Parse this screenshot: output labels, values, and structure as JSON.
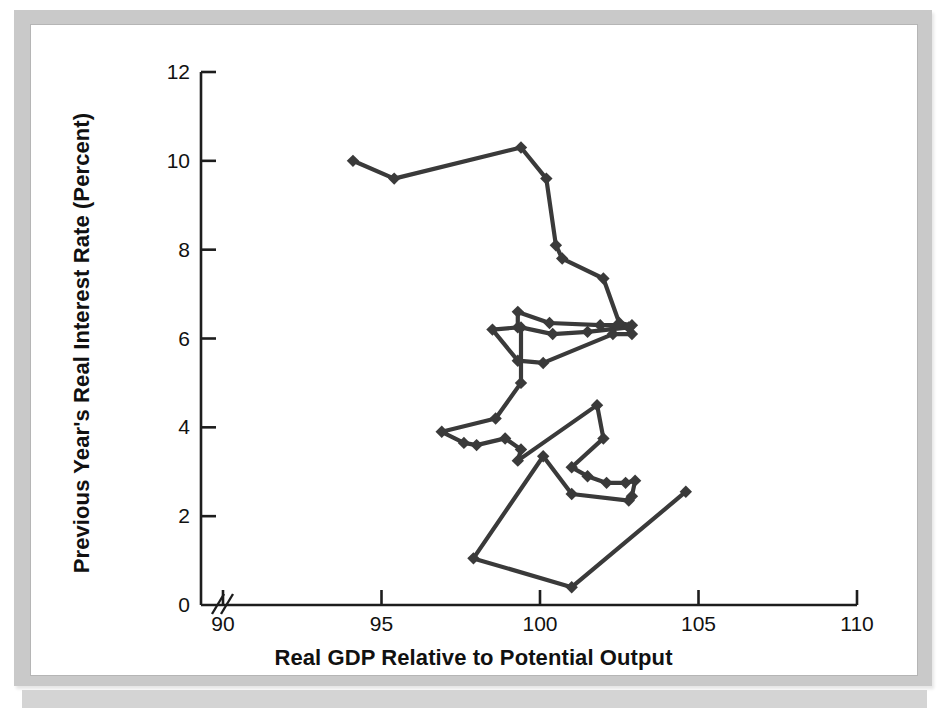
{
  "figure": {
    "background_color": "#ffffff",
    "frame_color": "#c9c9c9",
    "series_color": "#3a3a3a"
  },
  "axes": {
    "x_title": "Real GDP Relative to Potential Output",
    "y_title": "Previous Year's Real Interest Rate (Percent)",
    "x_ticks": [
      "90",
      "95",
      "100",
      "105",
      "110"
    ],
    "y_ticks": [
      "0",
      "2",
      "4",
      "6",
      "8",
      "10",
      "12"
    ],
    "x_break_symbol": "//"
  },
  "chart_data": {
    "type": "line",
    "title": "",
    "subtitle": "",
    "xlabel": "Real GDP Relative to Potential Output",
    "ylabel": "Previous Year's Real Interest Rate (Percent)",
    "xlim": [
      89,
      110
    ],
    "ylim": [
      0,
      12
    ],
    "x_ticks": [
      90,
      95,
      100,
      105,
      110
    ],
    "y_ticks": [
      0,
      2,
      4,
      6,
      8,
      10,
      12
    ],
    "grid": false,
    "legend": null,
    "marker": "diamond",
    "axis_break_x": true,
    "series": [
      {
        "name": "Real GDP vs previous year's real interest rate",
        "points": [
          [
            94.1,
            10.0
          ],
          [
            95.4,
            9.6
          ],
          [
            99.4,
            10.3
          ],
          [
            100.2,
            9.6
          ],
          [
            100.5,
            8.1
          ],
          [
            100.7,
            7.8
          ],
          [
            102.0,
            7.35
          ],
          [
            102.5,
            6.35
          ],
          [
            102.9,
            6.3
          ],
          [
            101.9,
            6.3
          ],
          [
            100.3,
            6.35
          ],
          [
            99.3,
            6.6
          ],
          [
            99.3,
            6.25
          ],
          [
            98.5,
            6.2
          ],
          [
            99.3,
            5.5
          ],
          [
            100.1,
            5.45
          ],
          [
            102.3,
            6.1
          ],
          [
            102.9,
            6.1
          ],
          [
            102.8,
            6.25
          ],
          [
            101.5,
            6.15
          ],
          [
            100.4,
            6.1
          ],
          [
            99.4,
            6.25
          ],
          [
            99.4,
            5.0
          ],
          [
            98.6,
            4.2
          ],
          [
            96.9,
            3.9
          ],
          [
            97.6,
            3.65
          ],
          [
            98.0,
            3.6
          ],
          [
            98.9,
            3.75
          ],
          [
            99.4,
            3.5
          ],
          [
            99.3,
            3.25
          ],
          [
            101.8,
            4.5
          ],
          [
            102.0,
            3.75
          ],
          [
            101.0,
            3.1
          ],
          [
            101.5,
            2.9
          ],
          [
            102.1,
            2.75
          ],
          [
            102.7,
            2.75
          ],
          [
            103.0,
            2.8
          ],
          [
            102.9,
            2.45
          ],
          [
            102.8,
            2.35
          ],
          [
            101.0,
            2.5
          ],
          [
            100.1,
            3.35
          ],
          [
            97.9,
            1.05
          ],
          [
            101.0,
            0.4
          ],
          [
            104.6,
            2.55
          ]
        ]
      }
    ]
  }
}
